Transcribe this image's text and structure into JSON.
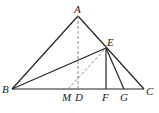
{
  "diagram": {
    "type": "geometry",
    "points": {
      "A": {
        "label": "A",
        "x": 78,
        "y": 16
      },
      "B": {
        "label": "B",
        "x": 12,
        "y": 89
      },
      "C": {
        "label": "C",
        "x": 144,
        "y": 89
      },
      "D": {
        "label": "D",
        "x": 78,
        "y": 89
      },
      "E": {
        "label": "E",
        "x": 106,
        "y": 48
      },
      "F": {
        "label": "F",
        "x": 106,
        "y": 89
      },
      "G": {
        "label": "G",
        "x": 124,
        "y": 89
      },
      "M": {
        "label": "M",
        "x": 68,
        "y": 89
      }
    },
    "solid_segments": [
      "AB",
      "AC",
      "BC",
      "BE",
      "EF",
      "EG"
    ],
    "dashed_segments": [
      "AD",
      "ME"
    ],
    "colors": {
      "line": "#222222",
      "dashed": "#888888",
      "background": "#ffffff"
    }
  }
}
